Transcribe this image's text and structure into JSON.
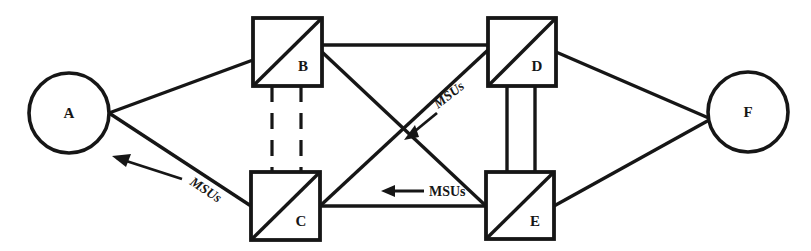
{
  "diagram": {
    "canvas": {
      "width": 811,
      "height": 251
    },
    "colors": {
      "stroke": "#161616",
      "background": "#ffffff",
      "fill": "#ffffff"
    },
    "nodes": [
      {
        "id": "A",
        "label": "A",
        "shape": "circle",
        "cx": 69,
        "cy": 113,
        "r": 40,
        "label_x": 69,
        "label_y": 118
      },
      {
        "id": "B",
        "label": "B",
        "shape": "square-diagonal",
        "x": 253,
        "y": 18,
        "w": 69,
        "h": 68,
        "label_x": 303,
        "label_y": 71
      },
      {
        "id": "C",
        "label": "C",
        "shape": "square-diagonal",
        "x": 251,
        "y": 172,
        "w": 69,
        "h": 68,
        "label_x": 301,
        "label_y": 226
      },
      {
        "id": "D",
        "label": "D",
        "shape": "square-diagonal",
        "x": 488,
        "y": 18,
        "w": 68,
        "h": 68,
        "label_x": 537,
        "label_y": 71
      },
      {
        "id": "E",
        "label": "E",
        "shape": "square-diagonal",
        "x": 486,
        "y": 172,
        "w": 68,
        "h": 67,
        "label_x": 535,
        "label_y": 226
      },
      {
        "id": "F",
        "label": "F",
        "shape": "circle",
        "cx": 748,
        "cy": 112,
        "r": 40,
        "label_x": 748,
        "label_y": 117
      }
    ],
    "links": [
      {
        "id": "A-B",
        "from": "A",
        "to": "B",
        "style": "solid"
      },
      {
        "id": "A-C",
        "from": "A",
        "to": "C",
        "style": "solid"
      },
      {
        "id": "B-C",
        "from": "B",
        "to": "C",
        "style": "dashed-double"
      },
      {
        "id": "B-D",
        "from": "B",
        "to": "D",
        "style": "solid"
      },
      {
        "id": "B-E",
        "from": "B",
        "to": "E",
        "style": "solid"
      },
      {
        "id": "C-D",
        "from": "C",
        "to": "D",
        "style": "solid"
      },
      {
        "id": "C-E",
        "from": "C",
        "to": "E",
        "style": "solid"
      },
      {
        "id": "D-E",
        "from": "D",
        "to": "E",
        "style": "solid-double"
      },
      {
        "id": "D-F",
        "from": "D",
        "to": "F",
        "style": "solid"
      },
      {
        "id": "E-F",
        "from": "E",
        "to": "F",
        "style": "solid"
      }
    ],
    "annotations": [
      {
        "id": "msu-a-c",
        "text": "MSUs",
        "on_link": "A-C",
        "direction": "toward-A",
        "rotation": 33,
        "text_x": 200,
        "text_y": 191
      },
      {
        "id": "msu-d-c",
        "text": "MSUs",
        "on_link": "C-D",
        "direction": "toward-C",
        "rotation": -38,
        "text_x": 457,
        "text_y": 110
      },
      {
        "id": "msu-e-c",
        "text": "MSUs",
        "on_link": "C-E",
        "direction": "toward-C",
        "rotation": 0,
        "text_x": 429,
        "text_y": 196
      }
    ]
  }
}
